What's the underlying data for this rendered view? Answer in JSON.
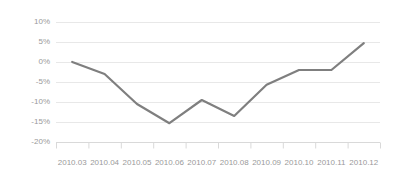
{
  "chart_data": {
    "type": "line",
    "title": "",
    "subtitle": "",
    "xlabel": "",
    "ylabel": "",
    "categories": [
      "2010.03",
      "2010.04",
      "2010.05",
      "2010.06",
      "2010.07",
      "2010.08",
      "2010.09",
      "2010.10",
      "2010.11",
      "2010.12"
    ],
    "values": [
      0,
      -3,
      -10.5,
      -15.3,
      -9.5,
      -13.5,
      -5.7,
      -2,
      -2,
      4.7
    ],
    "series": [
      {
        "name": "",
        "values": [
          0,
          -3,
          -10.5,
          -15.3,
          -9.5,
          -13.5,
          -5.7,
          -2,
          -2,
          4.7
        ]
      }
    ],
    "ylim": [
      -20,
      10
    ],
    "ytick_values": [
      10,
      5,
      0,
      -5,
      -10,
      -15,
      -20
    ],
    "ytick_labels": [
      "10%",
      "5%",
      "0%",
      "-5%",
      "-10%",
      "-15%",
      "-20%"
    ],
    "xtick_labels": [
      "2010.03",
      "2010.04",
      "2010.05",
      "2010.06",
      "2010.07",
      "2010.08",
      "2010.09",
      "2010.10",
      "2010.11",
      "2010.12"
    ],
    "grid": true,
    "grid_axis": "y",
    "legend": false,
    "legend_position": "none",
    "annotations": [],
    "markers": false,
    "unit": "%"
  },
  "style": {
    "line_color": "#7f7f7f",
    "grid_color": "#e8e8e8",
    "axis_color": "#d9d9d9",
    "tick_label_color": "#9a9a9a",
    "background": "#ffffff",
    "line_width": 2.2
  }
}
